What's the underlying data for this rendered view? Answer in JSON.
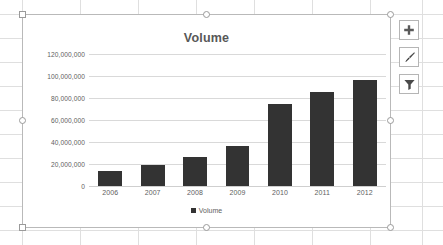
{
  "app": {
    "context": "excel-worksheet-with-selected-chart"
  },
  "chart_object": {
    "selected": true,
    "handles": [
      "top-left",
      "top-center",
      "top-right",
      "middle-left",
      "middle-right",
      "bottom-left",
      "bottom-center",
      "bottom-right"
    ]
  },
  "side_buttons": [
    {
      "name": "chart-elements-button",
      "icon": "plus-icon",
      "tooltip": "Chart Elements"
    },
    {
      "name": "chart-styles-button",
      "icon": "paintbrush-icon",
      "tooltip": "Chart Styles"
    },
    {
      "name": "chart-filters-button",
      "icon": "funnel-icon",
      "tooltip": "Chart Filters"
    }
  ],
  "colors": {
    "bar": "#333333",
    "title_text": "#585858",
    "axis_text": "#5e5e5e",
    "gridline": "#d9d9d9",
    "chart_border": "#b9b9b9",
    "sheet_gridline": "#dfdfdf"
  },
  "chart_data": {
    "type": "bar",
    "title": "Volume",
    "xlabel": "",
    "ylabel": "",
    "categories": [
      "2006",
      "2007",
      "2008",
      "2009",
      "2010",
      "2011",
      "2012"
    ],
    "values": [
      14000000,
      19000000,
      26500000,
      36500000,
      75000000,
      85500000,
      96000000
    ],
    "series": [
      {
        "name": "Volume",
        "values": [
          14000000,
          19000000,
          26500000,
          36500000,
          75000000,
          85500000,
          96000000
        ]
      }
    ],
    "ylim": [
      0,
      120000000
    ],
    "ytick_values": [
      0,
      20000000,
      40000000,
      60000000,
      80000000,
      100000000,
      120000000
    ],
    "ytick_labels": [
      "0",
      "20,000,000",
      "40,000,000",
      "60,000,000",
      "80,000,000",
      "100,000,000",
      "120,000,000"
    ],
    "grid": true,
    "legend": {
      "position": "bottom",
      "entries": [
        "Volume"
      ]
    }
  }
}
